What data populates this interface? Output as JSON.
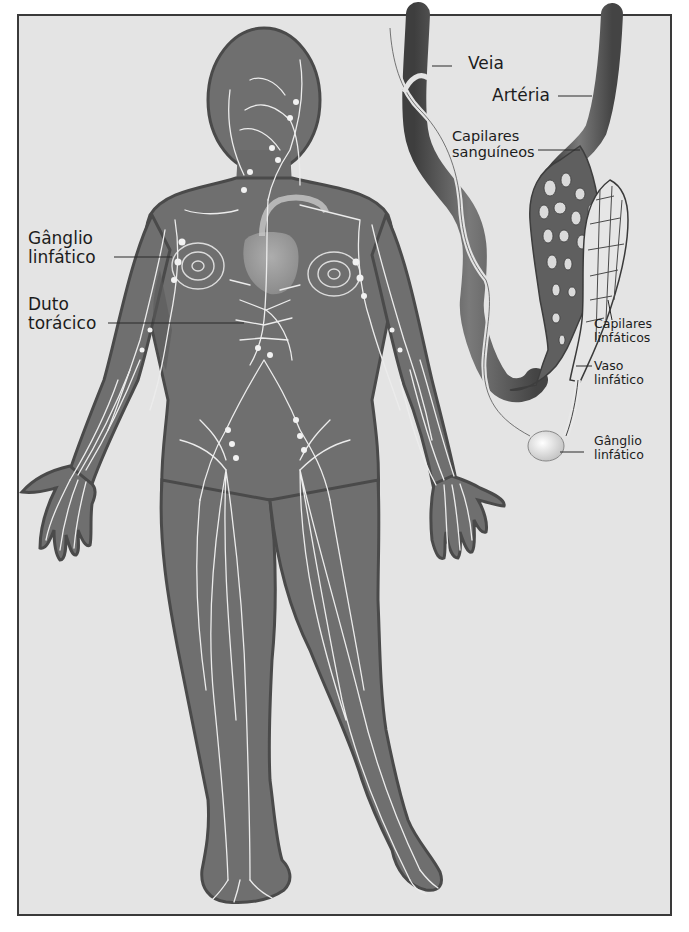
{
  "figure": {
    "topic": "Sistema linfático",
    "colors": {
      "background": "#e4e4e4",
      "frame": "#3a3a3a",
      "body": "#6f6f6f",
      "body_outline": "#4a4a4a",
      "vessel": "#eeeeee",
      "blood_vessel": "#5e5e5e",
      "label_text": "#1c1c1c",
      "leader_line": "#2a2a2a"
    }
  },
  "labels": {
    "ganglio_body": {
      "line1": "Gânglio",
      "line2": "linfático"
    },
    "duto_toracico": {
      "line1": "Duto",
      "line2": "torácico"
    },
    "veia": {
      "text": "Veia"
    },
    "arteria": {
      "text": "Artéria"
    },
    "capilares_sanguineos": {
      "line1": "Capilares",
      "line2": "sanguíneos"
    },
    "capilares_linfaticos": {
      "line1": "Capilares",
      "line2": "linfáticos"
    },
    "vaso_linfatico": {
      "line1": "Vaso",
      "line2": "linfático"
    },
    "ganglio_detail": {
      "line1": "Gânglio",
      "line2": "linfático"
    }
  }
}
